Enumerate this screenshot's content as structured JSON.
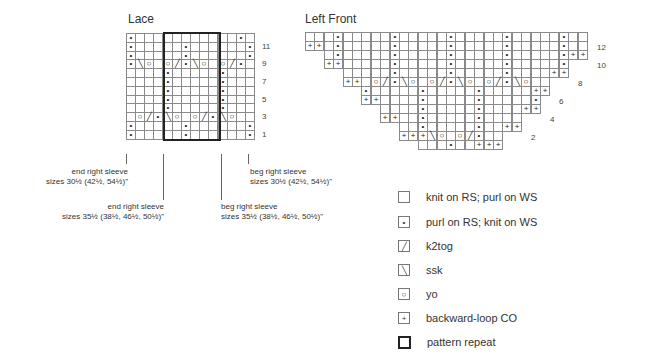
{
  "lace": {
    "title": "Lace",
    "cols": 14,
    "rows": [
      {
        "n": 12,
        "cells": "p...........p"
      },
      {
        "n": 11,
        "cells": "p.....p......p"
      },
      {
        "n": 10,
        "cells": "p.....p......p"
      },
      {
        "n": 9,
        "cells": "p\\o.o/p\\o.o/p"
      },
      {
        "n": 8,
        "cells": "....p.....p..."
      },
      {
        "n": 7,
        "cells": "....p.....p..."
      },
      {
        "n": 6,
        "cells": "....p.....p..."
      },
      {
        "n": 5,
        "cells": "....p.....p..."
      },
      {
        "n": 4,
        "cells": "....p.....p..."
      },
      {
        "n": 3,
        "cells": ".o/p\\o.o/p\\o."
      },
      {
        "n": 2,
        "cells": "p.....p......p"
      },
      {
        "n": 1,
        "cells": "p.....p......p"
      }
    ],
    "row_labels": [
      "11",
      "9",
      "7",
      "5",
      "3",
      "1"
    ],
    "repeat": {
      "start_col": 5,
      "end_col": 10
    },
    "annotations": [
      {
        "line1": "end right sleeve",
        "line2": "sizes 30½ (42½, 54½)\""
      },
      {
        "line1": "end right sleeve",
        "line2": "sizes 35½ (38½, 46½, 50½)\""
      },
      {
        "line1": "beg right sleeve",
        "line2": "sizes 30½ (42½, 54½)\""
      },
      {
        "line1": "beg right sleeve",
        "line2": "sizes 35½ (38½, 46½, 50½)\""
      }
    ]
  },
  "left_front": {
    "title": "Left Front",
    "cols": 30,
    "rows": [
      {
        "start": 1,
        "end": 30,
        "cells": {
          "4": "p",
          "10": "p",
          "16": "p",
          "22": "p",
          "28": "p"
        }
      },
      {
        "start": 1,
        "end": 30,
        "cells": {
          "1": "+",
          "2": "+",
          "4": "p",
          "10": "p",
          "16": "p",
          "22": "p",
          "28": "p"
        }
      },
      {
        "start": 3,
        "end": 30,
        "cells": {
          "4": "p",
          "10": "p",
          "16": "p",
          "22": "p",
          "28": "p",
          "29": "+",
          "30": "+"
        }
      },
      {
        "start": 3,
        "end": 28,
        "cells": {
          "3": "+",
          "4": "+",
          "10": "p",
          "16": "p",
          "22": "p",
          "28": "p"
        }
      },
      {
        "start": 5,
        "end": 28,
        "cells": {
          "10": "p",
          "16": "p",
          "22": "p",
          "27": "+",
          "28": "+"
        }
      },
      {
        "start": 5,
        "end": 26,
        "cells": {
          "5": "+",
          "6": "+",
          "8": "o",
          "9": "/",
          "10": "p",
          "11": "\\",
          "12": "o",
          "14": "o",
          "15": "/",
          "16": "p",
          "17": "\\",
          "18": "o",
          "20": "o",
          "21": "/",
          "22": "p",
          "23": "\\",
          "24": "o"
        }
      },
      {
        "start": 7,
        "end": 26,
        "cells": {
          "7": "p",
          "13": "p",
          "19": "p",
          "25": "+",
          "26": "+"
        }
      },
      {
        "start": 7,
        "end": 25,
        "cells": {
          "7": "+",
          "8": "+",
          "13": "p",
          "19": "p",
          "25": "p"
        }
      },
      {
        "start": 9,
        "end": 25,
        "cells": {
          "13": "p",
          "19": "p",
          "24": "+",
          "25": "+"
        }
      },
      {
        "start": 9,
        "end": 23,
        "cells": {
          "9": "+",
          "10": "+",
          "13": "p",
          "19": "p"
        }
      },
      {
        "start": 11,
        "end": 23,
        "cells": {
          "13": "p",
          "19": "p",
          "22": "+",
          "23": "+"
        }
      },
      {
        "start": 11,
        "end": 21,
        "cells": {
          "11": "+",
          "12": "+",
          "13": "+",
          "14": "\\",
          "15": "o",
          "17": "o",
          "18": "/",
          "19": "p"
        }
      },
      {
        "start": 13,
        "end": 21,
        "cells": {
          "16": "p",
          "19": "+",
          "20": "+",
          "21": "+"
        }
      }
    ],
    "row_labels": [
      {
        "text": "12",
        "row": 1
      },
      {
        "text": "10",
        "row": 3
      },
      {
        "text": "8",
        "row": 5
      },
      {
        "text": "6",
        "row": 7
      },
      {
        "text": "4",
        "row": 9
      },
      {
        "text": "2",
        "row": 11
      }
    ]
  },
  "symbols": {
    "p": "•",
    "o": "○",
    "/": "╱",
    "\\": "╲",
    "+": "+"
  },
  "legend": [
    {
      "symbol": "",
      "label": "knit on RS; purl on WS",
      "icon": "empty-square-icon"
    },
    {
      "symbol": "•",
      "label": "purl on RS; knit on WS",
      "icon": "dot-icon"
    },
    {
      "symbol": "╱",
      "label": "k2tog",
      "icon": "right-slant-icon"
    },
    {
      "symbol": "╲",
      "label": "ssk",
      "icon": "left-slant-icon"
    },
    {
      "symbol": "○",
      "label": "yo",
      "icon": "circle-icon"
    },
    {
      "symbol": "+",
      "label": "backward-loop CO",
      "icon": "plus-icon"
    },
    {
      "symbol": "",
      "label": "pattern repeat",
      "icon": "bold-square-icon"
    }
  ]
}
